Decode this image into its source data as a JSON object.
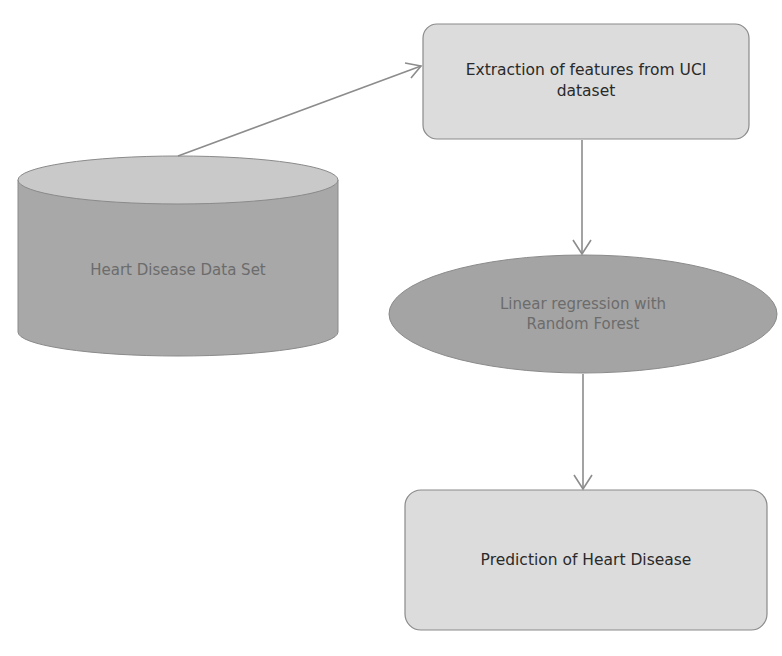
{
  "diagram": {
    "nodes": {
      "dataset": {
        "label": "Heart Disease Data Set",
        "shape": "cylinder",
        "fill": "#a8a8a8",
        "top_fill": "#c9c9c9"
      },
      "extraction": {
        "label": "Extraction of features from UCI dataset",
        "shape": "rounded-rectangle",
        "fill": "#dcdcdc"
      },
      "model": {
        "label": "Linear regression with Random Forest",
        "shape": "ellipse",
        "fill": "#a4a4a4"
      },
      "prediction": {
        "label": "Prediction of Heart Disease",
        "shape": "rounded-rectangle",
        "fill": "#dcdcdc"
      }
    },
    "edges": [
      {
        "from": "dataset",
        "to": "extraction"
      },
      {
        "from": "extraction",
        "to": "model"
      },
      {
        "from": "model",
        "to": "prediction"
      }
    ],
    "colors": {
      "stroke": "#7a7a7a",
      "arrow": "#8c8c8c"
    }
  }
}
